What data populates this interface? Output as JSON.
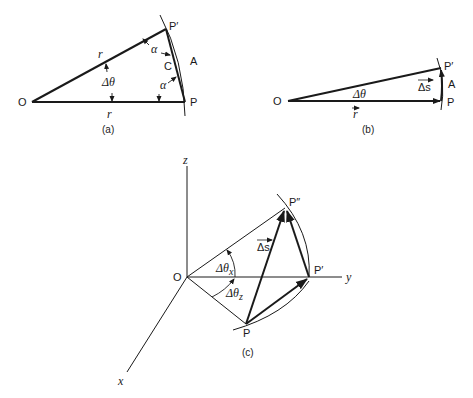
{
  "figure": {
    "panels": [
      {
        "id": "a",
        "caption": "(a)",
        "labels": {
          "origin": "O",
          "point_p": "P",
          "point_p_prime": "P′",
          "arc": "A",
          "chord": "C",
          "radius_upper": "r",
          "radius_lower": "r",
          "angle": "Δθ",
          "alpha_top": "α",
          "alpha_bottom": "α"
        }
      },
      {
        "id": "b",
        "caption": "(b)",
        "labels": {
          "origin": "O",
          "point_p": "P",
          "point_p_prime": "P′",
          "arc": "A",
          "angle": "Δθ",
          "vector_r": "r",
          "vector_ds": "Δs"
        }
      },
      {
        "id": "c",
        "caption": "(c)",
        "labels": {
          "origin": "O",
          "axis_x": "x",
          "axis_y": "y",
          "axis_z": "z",
          "point_p": "P",
          "point_p_prime": "P′",
          "point_p_double_prime": "P″",
          "vector_ds": "Δs",
          "angle_x": "Δθ",
          "angle_x_sub": "x",
          "angle_z": "Δθ",
          "angle_z_sub": "z"
        }
      }
    ],
    "colors": {
      "ink": "#1a1a1a",
      "background": "#ffffff"
    }
  }
}
